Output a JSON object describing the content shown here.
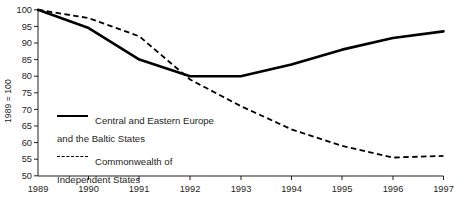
{
  "chart_data": {
    "type": "line",
    "title": "",
    "xlabel": "",
    "ylabel": "1989 = 100",
    "categories": [
      "1989",
      "1990",
      "1991",
      "1992",
      "1993",
      "1994",
      "1995",
      "1996",
      "1997"
    ],
    "x": [
      1989,
      1990,
      1991,
      1992,
      1993,
      1994,
      1995,
      1996,
      1997
    ],
    "xlim": [
      1989,
      1997
    ],
    "ylim": [
      50,
      100
    ],
    "yticks": [
      50,
      55,
      60,
      65,
      70,
      75,
      80,
      85,
      90,
      95,
      100
    ],
    "ytick_labels": [
      "50",
      "55",
      "60",
      "65",
      "70",
      "75",
      "80",
      "85",
      "90",
      "95",
      "100"
    ],
    "grid": false,
    "legend_position": "inside-left",
    "series": [
      {
        "name": "Central and Eastern Europe and the Baltic States",
        "style": "solid",
        "color": "#000000",
        "values": [
          100,
          94.5,
          85,
          80,
          80,
          83.5,
          88,
          91.5,
          93.5
        ]
      },
      {
        "name": "Commonwealth of Independent States",
        "style": "dashed",
        "color": "#000000",
        "values": [
          100,
          97.5,
          92,
          79,
          71,
          64,
          59,
          55.5,
          56
        ]
      }
    ]
  },
  "axis": {
    "ylabel": "1989 = 100",
    "ytick_labels": [
      "100",
      "95",
      "90",
      "85",
      "80",
      "75",
      "70",
      "65",
      "60",
      "55",
      "50"
    ],
    "xtick_labels": [
      "1989",
      "1990",
      "1991",
      "1992",
      "1993",
      "1994",
      "1995",
      "1996",
      "1997"
    ]
  },
  "legend": {
    "items": [
      {
        "label": "Central and Eastern Europe\nand the Baltic States",
        "style": "solid"
      },
      {
        "label": "Commonwealth of\nIndependent States",
        "style": "dashed"
      }
    ]
  },
  "colors": {
    "line": "#000000",
    "axis": "#231f20",
    "background": "#ffffff"
  }
}
